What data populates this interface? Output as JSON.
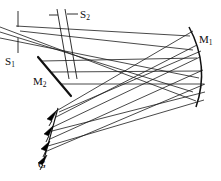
{
  "figure": {
    "type": "optical-ray-diagram",
    "width": 221,
    "height": 181,
    "background_color": "#ffffff",
    "line_color": "#1a1a1a"
  },
  "labels": {
    "s1": {
      "text": "S",
      "sub": "1",
      "x": 5,
      "y": 56
    },
    "s2": {
      "text": "S",
      "sub": "2",
      "x": 80,
      "y": 9
    },
    "m1": {
      "text": "M",
      "sub": "1",
      "x": 199,
      "y": 34
    },
    "m2": {
      "text": "M",
      "sub": "2",
      "x": 33,
      "y": 76
    },
    "g": {
      "text": "G",
      "sub": "",
      "x": 38,
      "y": 159
    }
  },
  "components": {
    "entrance_slit": {
      "name": "S1",
      "kind": "slit",
      "ticks": [
        {
          "x1": 18,
          "y1": 12,
          "x2": 18,
          "y2": 27
        },
        {
          "x1": 18,
          "y1": 38,
          "x2": 18,
          "y2": 53
        }
      ]
    },
    "exit_slit": {
      "name": "S2",
      "kind": "slit",
      "jaws": [
        {
          "x1": 58,
          "y1": 10,
          "x2": 70,
          "y2": 79
        },
        {
          "x1": 66,
          "y1": 10,
          "x2": 78,
          "y2": 79
        }
      ],
      "ticks": [
        {
          "x1": 49,
          "y1": 16,
          "x2": 58,
          "y2": 16
        },
        {
          "x1": 68,
          "y1": 15,
          "x2": 79,
          "y2": 15
        }
      ]
    },
    "mirror_flat": {
      "name": "M2",
      "kind": "flat-mirror",
      "x1": 38,
      "y1": 57,
      "x2": 70,
      "y2": 95
    },
    "mirror_curved": {
      "name": "M1",
      "kind": "concave-mirror",
      "path": "M 189 28 Q 209 66 197 106"
    },
    "grating": {
      "name": "G",
      "kind": "blazed-grating",
      "base": {
        "x1": 57,
        "y1": 109,
        "x2": 44,
        "y2": 161
      },
      "teeth_count": 4
    }
  },
  "beams": {
    "input_rays": [
      {
        "x1": 0,
        "y1": 28,
        "x2": 196,
        "y2": 100
      },
      {
        "x1": 0,
        "y1": 33,
        "x2": 193,
        "y2": 92
      },
      {
        "x1": 0,
        "y1": 39,
        "x2": 199,
        "y2": 79
      }
    ],
    "fold_rays": [
      {
        "x1": 58,
        "y1": 22,
        "x2": 190,
        "y2": 34
      },
      {
        "x1": 62,
        "y1": 48,
        "x2": 194,
        "y2": 52
      },
      {
        "x1": 66,
        "y1": 68,
        "x2": 199,
        "y2": 66
      },
      {
        "x1": 70,
        "y1": 84,
        "x2": 203,
        "y2": 80
      }
    ],
    "grating_rays": [
      {
        "x1": 56,
        "y1": 112,
        "x2": 196,
        "y2": 30
      },
      {
        "x1": 54,
        "y1": 122,
        "x2": 199,
        "y2": 46
      },
      {
        "x1": 50,
        "y1": 136,
        "x2": 203,
        "y2": 62
      },
      {
        "x1": 47,
        "y1": 150,
        "x2": 205,
        "y2": 78
      },
      {
        "x1": 58,
        "y1": 110,
        "x2": 202,
        "y2": 56
      },
      {
        "x1": 52,
        "y1": 128,
        "x2": 205,
        "y2": 90
      }
    ]
  },
  "icons": {
    "slit_icon": "slit-icon",
    "mirror_icon": "mirror-icon",
    "grating_icon": "grating-icon"
  }
}
